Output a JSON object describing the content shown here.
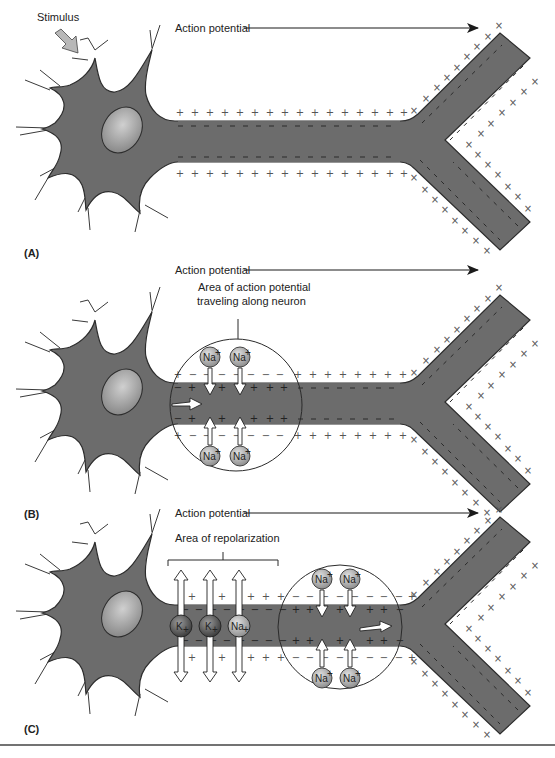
{
  "figure": {
    "panels": [
      {
        "id": "A",
        "label": "(A)",
        "stimulus_label": "Stimulus",
        "arrow_label": "Action potential",
        "offset_y": 0
      },
      {
        "id": "B",
        "label": "(B)",
        "arrow_label": "Action potential",
        "area_label_line1": "Area of action potential",
        "area_label_line2": "traveling along neuron",
        "ions": [
          "Na+",
          "Na+",
          "Na+",
          "Na+"
        ],
        "offset_y": 262
      },
      {
        "id": "C",
        "label": "(C)",
        "arrow_label": "Action potential",
        "area_label": "Area of repolarization",
        "repolarization_ions": [
          "K+",
          "K+",
          "Na+"
        ],
        "ions": [
          "Na+",
          "Na+",
          "Na+",
          "Na+"
        ],
        "offset_y": 500
      }
    ],
    "ion_text": {
      "na": "Na",
      "k": "K",
      "plus": "+",
      "minus": "−"
    },
    "colors": {
      "neuron_fill": "#6e6e6e",
      "neuron_edge": "#3a3a3a",
      "nucleus": "#a8a8a8",
      "ion_na": "#b5b5b5",
      "ion_k": "#6a6a6a",
      "arrow": "#ffffff",
      "stimulus_arrow": "#b8b8b8",
      "bottom_rule": "#444444"
    }
  }
}
